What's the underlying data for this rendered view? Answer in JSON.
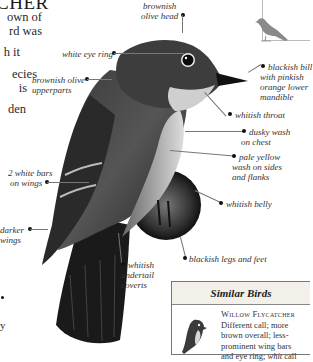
{
  "header": {
    "title_fragment": "CHER"
  },
  "body_text": {
    "lines": [
      "own of",
      "rd was",
      "",
      "h it",
      "",
      "ecies",
      "is",
      "",
      "den"
    ],
    "bottom_fragment": "y"
  },
  "illustration": {
    "subject": "flycatcher-bird",
    "labels": {
      "head": "brownish olive head",
      "head_l1": "brownish",
      "head_l2": "olive head",
      "eye_ring": "white eye ring",
      "upperparts_l1": "brownish olive",
      "upperparts_l2": "upperparts",
      "bill_l1": "blackish bill",
      "bill_l2": "with pinkish",
      "bill_l3": "orange lower",
      "bill_l4": "mandible",
      "throat": "whitish throat",
      "chest_l1": "dusky wash",
      "chest_l2": "on chest",
      "sides_l1": "pale yellow",
      "sides_l2": "wash on sides",
      "sides_l3": "and flanks",
      "belly": "whitish belly",
      "wingbars_l1": "2 white bars",
      "wingbars_l2": "on wings",
      "wings_l1": "darker",
      "wings_l2": "wings",
      "legs": "blackish legs and feet",
      "undertail_l1": "whitish",
      "undertail_l2": "undertail",
      "undertail_l3": "coverts"
    }
  },
  "silhouette": {
    "icon": "bird-silhouette-icon",
    "color": "#8a8a8a"
  },
  "similar_birds": {
    "heading": "Similar Birds",
    "species_name": "Willow Flycatcher",
    "lines": [
      "Different call; more",
      "brown overall; less-",
      "prominent wing bars",
      "and eye ring; "
    ],
    "call_word": "whit",
    "call_suffix": " call"
  }
}
